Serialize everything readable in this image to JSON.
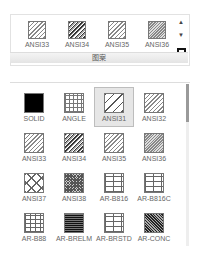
{
  "ribbon": {
    "title": "图案",
    "items": [
      {
        "label": "ANSI33",
        "pattern": "hatch-light"
      },
      {
        "label": "ANSI34",
        "pattern": "hatch-dark"
      },
      {
        "label": "ANSI35",
        "pattern": "hatch-light"
      },
      {
        "label": "ANSI36",
        "pattern": "hatch-dense"
      }
    ],
    "scroll_up": "▲",
    "scroll_down": "▼"
  },
  "gallery": {
    "selected": "ANSI31",
    "items": [
      {
        "label": "SOLID",
        "pattern": "solid"
      },
      {
        "label": "ANGLE",
        "pattern": "grid"
      },
      {
        "label": "ANSI31",
        "pattern": "hatch-sparse"
      },
      {
        "label": "ANSI32",
        "pattern": "hatch-light"
      },
      {
        "label": "ANSI33",
        "pattern": "hatch-light"
      },
      {
        "label": "ANSI34",
        "pattern": "hatch-dark"
      },
      {
        "label": "ANSI35",
        "pattern": "hatch-light"
      },
      {
        "label": "ANSI36",
        "pattern": "hatch-dense"
      },
      {
        "label": "ANSI37",
        "pattern": "cross"
      },
      {
        "label": "ANSI38",
        "pattern": "crosshatch"
      },
      {
        "label": "AR-B816",
        "pattern": "brick"
      },
      {
        "label": "AR-B816C",
        "pattern": "brick"
      },
      {
        "label": "AR-B88",
        "pattern": "brick-small"
      },
      {
        "label": "AR-BRELM",
        "pattern": "brick-dark"
      },
      {
        "label": "AR-BRSTD",
        "pattern": "brick"
      },
      {
        "label": "AR-CONC",
        "pattern": "concrete"
      }
    ]
  }
}
